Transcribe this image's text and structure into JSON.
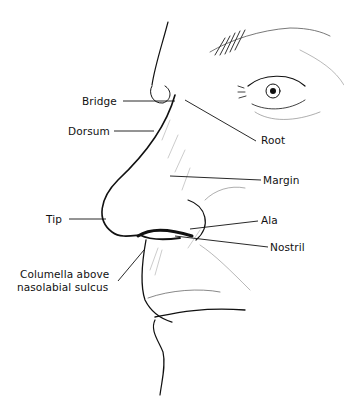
{
  "diagram": {
    "labels": [
      {
        "id": "bridge",
        "text": "Bridge"
      },
      {
        "id": "dorsum",
        "text": "Dorsum"
      },
      {
        "id": "root",
        "text": "Root"
      },
      {
        "id": "margin",
        "text": "Margin"
      },
      {
        "id": "tip",
        "text": "Tip"
      },
      {
        "id": "ala",
        "text": "Ala"
      },
      {
        "id": "nostril",
        "text": "Nostril"
      },
      {
        "id": "columella",
        "line1": "Columella above",
        "line2": "nasolabial sulcus"
      }
    ],
    "colors": {
      "ink": "#111111",
      "hatch": "#777777",
      "background": "#ffffff"
    }
  }
}
